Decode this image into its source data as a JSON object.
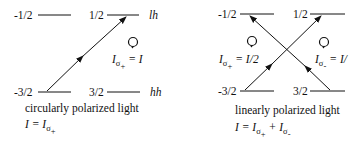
{
  "left_panel": {
    "levels": {
      "top_left": "-1/2",
      "top_right": "1/2",
      "bottom_left": "-3/2",
      "bottom_right": "3/2",
      "top_band": "lh",
      "bottom_band": "hh"
    },
    "intensity": {
      "I": "I",
      "sigma": "σ",
      "sub": "+",
      "eq": "= I"
    },
    "caption": "circularly polarized light",
    "formula": {
      "lhs": "I = I",
      "sigma": "σ",
      "sub": "+"
    }
  },
  "right_panel": {
    "levels": {
      "top_left": "-1/2",
      "top_right": "1/2",
      "bottom_left": "-3/2",
      "bottom_right": "3/2"
    },
    "intensity_plus": {
      "I": "I",
      "sigma": "σ",
      "sub": "+",
      "eq": "= I/2"
    },
    "intensity_minus": {
      "I": "I",
      "sigma": "σ",
      "sub": "-",
      "eq": "= I/"
    },
    "caption": "linearly polarized light",
    "formula": {
      "lhs": "I = I",
      "sigma1": "σ",
      "sub1": "+",
      "plus": "+ I",
      "sigma2": "σ",
      "sub2": "-"
    }
  },
  "colors": {
    "line": "#111111",
    "background": "#ffffff"
  }
}
